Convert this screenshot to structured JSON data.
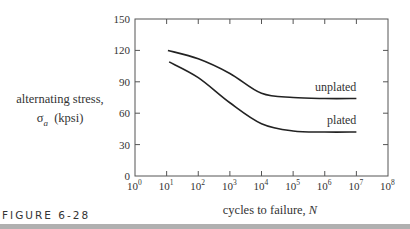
{
  "chart_data": {
    "type": "line",
    "title": "",
    "xlabel": "cycles to failure, N",
    "ylabel": "alternating stress, σa (kpsi)",
    "x_scale": "log",
    "xlim": [
      1,
      100000000
    ],
    "ylim": [
      0,
      150
    ],
    "x_ticks": [
      "10^0",
      "10^1",
      "10^2",
      "10^3",
      "10^4",
      "10^5",
      "10^6",
      "10^7",
      "10^8"
    ],
    "y_ticks": [
      0,
      30,
      60,
      90,
      120,
      150
    ],
    "grid": false,
    "legend": "inline labels at right end of curves",
    "series": [
      {
        "name": "unplated",
        "x": [
          11,
          100,
          1000,
          10000,
          100000,
          1000000,
          10000000
        ],
        "values": [
          120,
          112,
          98,
          79,
          75,
          74,
          74
        ]
      },
      {
        "name": "plated",
        "x": [
          12,
          100,
          1000,
          10000,
          100000,
          1000000,
          10000000
        ],
        "values": [
          109,
          94,
          70,
          50,
          43,
          42,
          42
        ]
      }
    ]
  },
  "labels": {
    "y_axis_line1": "alternating stress,",
    "y_axis_line2_symbol": "σ",
    "y_axis_line2_sub": "a",
    "y_axis_line2_unit": "(kpsi)",
    "x_axis_text": "cycles to failure, ",
    "x_axis_var": "N",
    "figure_caption": "FIGURE 6-28"
  }
}
